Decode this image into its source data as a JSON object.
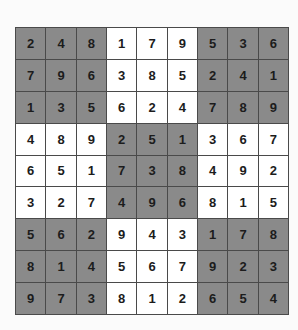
{
  "puzzle": {
    "type": "sudoku",
    "colors": {
      "shaded": "#8a8a8a",
      "light": "#ffffff",
      "text": "#1c1c1c"
    },
    "shaded_boxes": [
      0,
      2,
      4,
      6,
      8
    ],
    "rows": [
      [
        "2",
        "4",
        "8",
        "1",
        "7",
        "9",
        "5",
        "3",
        "6"
      ],
      [
        "7",
        "9",
        "6",
        "3",
        "8",
        "5",
        "2",
        "4",
        "1"
      ],
      [
        "1",
        "3",
        "5",
        "6",
        "2",
        "4",
        "7",
        "8",
        "9"
      ],
      [
        "4",
        "8",
        "9",
        "2",
        "5",
        "1",
        "3",
        "6",
        "7"
      ],
      [
        "6",
        "5",
        "1",
        "7",
        "3",
        "8",
        "4",
        "9",
        "2"
      ],
      [
        "3",
        "2",
        "7",
        "4",
        "9",
        "6",
        "8",
        "1",
        "5"
      ],
      [
        "5",
        "6",
        "2",
        "9",
        "4",
        "3",
        "1",
        "7",
        "8"
      ],
      [
        "8",
        "1",
        "4",
        "5",
        "6",
        "7",
        "9",
        "2",
        "3"
      ],
      [
        "9",
        "7",
        "3",
        "8",
        "1",
        "2",
        "6",
        "5",
        "4"
      ]
    ]
  }
}
